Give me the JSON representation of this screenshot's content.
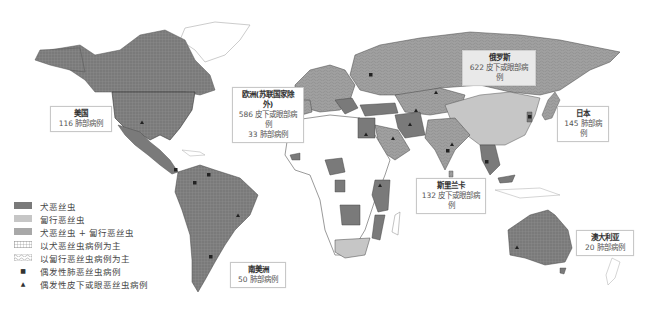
{
  "colors": {
    "dirofilaria_immitis": "#7a7a7a",
    "dirofilaria_repens": "#c6c6c6",
    "both": "#a8a8a8",
    "land_unaffected": "#ffffff",
    "border": "#555555",
    "ocean": "#ffffff"
  },
  "callouts": {
    "usa": {
      "title": "美国",
      "line1": "116 肺部病例"
    },
    "europe": {
      "title": "欧洲(苏联国家除外)",
      "line1": "586 皮下或眼部病例",
      "line2": "33 肺部病例"
    },
    "russia": {
      "title": "俄罗斯",
      "line1": "622 皮下或眼部病例"
    },
    "japan": {
      "title": "日本",
      "line1": "145 肺部病例"
    },
    "sri_lanka": {
      "title": "斯里兰卡",
      "line1": "132 皮下或眼部病例"
    },
    "australia": {
      "title": "澳大利亚",
      "line1": "20 肺部病例"
    },
    "south_america": {
      "title": "南美洲",
      "line1": "50 肺部病例"
    }
  },
  "legend": {
    "items": [
      {
        "label": "犬恶丝虫",
        "type": "fill",
        "swatch": "dirofilaria_immitis"
      },
      {
        "label": "匐行恶丝虫",
        "type": "fill",
        "swatch": "dirofilaria_repens"
      },
      {
        "label": "犬恶丝虫 + 匐行恶丝虫",
        "type": "fill",
        "swatch": "both"
      },
      {
        "label": "以犬恶丝虫病例为主",
        "type": "pattern",
        "swatch": "grid"
      },
      {
        "label": "以匐行恶丝虫病例为主",
        "type": "pattern",
        "swatch": "wave"
      },
      {
        "label": "偶发性肺恶丝虫病例",
        "type": "marker",
        "symbol": "■"
      },
      {
        "label": "偶发性皮下或眼恶丝虫病例",
        "type": "marker",
        "symbol": "▲"
      }
    ]
  }
}
